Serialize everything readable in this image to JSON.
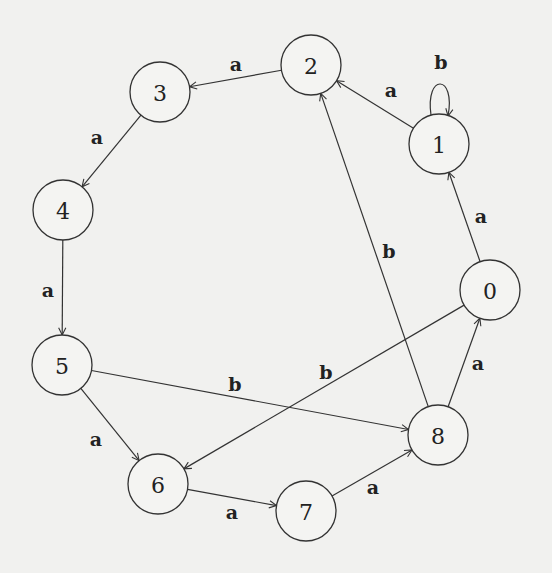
{
  "diagram": {
    "type": "state-automaton",
    "node_radius": 30,
    "nodes": [
      {
        "id": "0",
        "label": "0",
        "x": 490,
        "y": 290
      },
      {
        "id": "1",
        "label": "1",
        "x": 439,
        "y": 144
      },
      {
        "id": "2",
        "label": "2",
        "x": 311,
        "y": 65
      },
      {
        "id": "3",
        "label": "3",
        "x": 160,
        "y": 92
      },
      {
        "id": "4",
        "label": "4",
        "x": 63,
        "y": 210
      },
      {
        "id": "5",
        "label": "5",
        "x": 62,
        "y": 365
      },
      {
        "id": "6",
        "label": "6",
        "x": 158,
        "y": 484
      },
      {
        "id": "7",
        "label": "7",
        "x": 306,
        "y": 511
      },
      {
        "id": "8",
        "label": "8",
        "x": 438,
        "y": 435
      }
    ],
    "edges": [
      {
        "from": "0",
        "to": "1",
        "label": "a",
        "lx": 481,
        "ly": 216
      },
      {
        "from": "1",
        "to": "1",
        "label": "b",
        "loop": true,
        "lx": 441,
        "ly": 62
      },
      {
        "from": "1",
        "to": "2",
        "label": "a",
        "lx": 391,
        "ly": 90
      },
      {
        "from": "2",
        "to": "3",
        "label": "a",
        "lx": 236,
        "ly": 64
      },
      {
        "from": "3",
        "to": "4",
        "label": "a",
        "lx": 97,
        "ly": 137
      },
      {
        "from": "4",
        "to": "5",
        "label": "a",
        "lx": 48,
        "ly": 290
      },
      {
        "from": "5",
        "to": "6",
        "label": "a",
        "lx": 96,
        "ly": 439
      },
      {
        "from": "5",
        "to": "8",
        "label": "b",
        "lx": 235,
        "ly": 384
      },
      {
        "from": "0",
        "to": "6",
        "label": "b",
        "lx": 326,
        "ly": 372
      },
      {
        "from": "6",
        "to": "7",
        "label": "a",
        "lx": 232,
        "ly": 512
      },
      {
        "from": "7",
        "to": "8",
        "label": "a",
        "lx": 373,
        "ly": 487
      },
      {
        "from": "8",
        "to": "0",
        "label": "a",
        "lx": 478,
        "ly": 363
      },
      {
        "from": "8",
        "to": "2",
        "label": "b",
        "lx": 389,
        "ly": 251
      }
    ]
  }
}
